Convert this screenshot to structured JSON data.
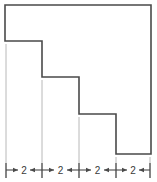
{
  "figure": {
    "background_color": "#ffffff",
    "outline_color": "#4a4a4a",
    "extension_line_color": "#b8b8b8",
    "dimension_line_color": "#4a4a4a",
    "label_color": "#3a3a3a",
    "units_per_segment": 2,
    "shape": {
      "name": "staircase-polygon",
      "vertices": [
        [
          5,
          5
        ],
        [
          151,
          5
        ],
        [
          151,
          154
        ],
        [
          116,
          154
        ],
        [
          116,
          114
        ],
        [
          79,
          114
        ],
        [
          79,
          77
        ],
        [
          42,
          77
        ],
        [
          42,
          41
        ],
        [
          5,
          41
        ]
      ]
    },
    "steps": [
      {
        "index": 1,
        "riser_x": 42,
        "tread_y": 41,
        "width_label": "2"
      },
      {
        "index": 2,
        "riser_x": 79,
        "tread_y": 77,
        "width_label": "2"
      },
      {
        "index": 3,
        "riser_x": 116,
        "tread_y": 114,
        "width_label": "2"
      },
      {
        "index": 4,
        "riser_x": 151,
        "tread_y": 154,
        "width_label": "2"
      }
    ],
    "extension_lines": [
      {
        "x": 6,
        "y_top": 44,
        "y_bottom": 178
      },
      {
        "x": 42,
        "y_top": 80,
        "y_bottom": 178
      },
      {
        "x": 79,
        "y_top": 117,
        "y_bottom": 178
      },
      {
        "x": 116,
        "y_top": 157,
        "y_bottom": 178
      },
      {
        "x": 150,
        "y_top": 157,
        "y_bottom": 178
      }
    ],
    "dimension_line": {
      "y": 170,
      "ticks": [
        6,
        42,
        79,
        116,
        150
      ],
      "segments": [
        {
          "id": 1,
          "x_start": 6,
          "x_end": 42,
          "label": "2",
          "label_x": 24,
          "label_y": 173
        },
        {
          "id": 2,
          "x_start": 42,
          "x_end": 79,
          "label": "2",
          "label_x": 60.5,
          "label_y": 173
        },
        {
          "id": 3,
          "x_start": 79,
          "x_end": 116,
          "label": "2",
          "label_x": 97.5,
          "label_y": 173
        },
        {
          "id": 4,
          "x_start": 116,
          "x_end": 150,
          "label": "2",
          "label_x": 133,
          "label_y": 173
        }
      ]
    }
  }
}
